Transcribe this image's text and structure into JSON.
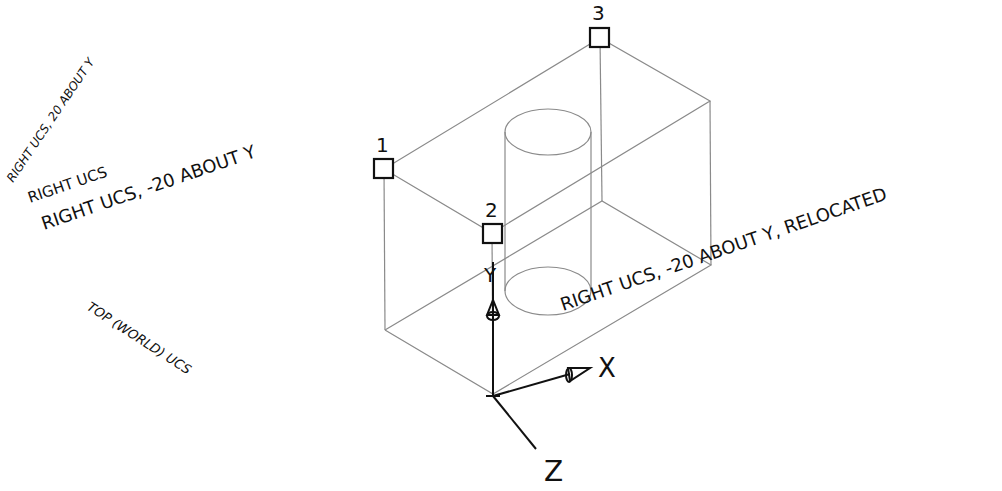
{
  "diagram": {
    "labels": {
      "right_ucs_20_about_y": "RIGHT UCS, 20 ABOUT Y",
      "right_ucs": "RIGHT UCS",
      "right_ucs_neg20_about_y": "RIGHT UCS, -20 ABOUT Y",
      "top_world_ucs": "TOP (WORLD) UCS",
      "relocated": "RIGHT UCS, -20 ABOUT Y, RELOCATED"
    },
    "points": [
      {
        "id": "1",
        "label": "1"
      },
      {
        "id": "2",
        "label": "2"
      },
      {
        "id": "3",
        "label": "3"
      }
    ],
    "axes": {
      "x": "X",
      "y": "Y",
      "z": "Z"
    },
    "colors": {
      "edges": "#8a8a8a",
      "ink": "#111111",
      "background": "#ffffff"
    }
  }
}
